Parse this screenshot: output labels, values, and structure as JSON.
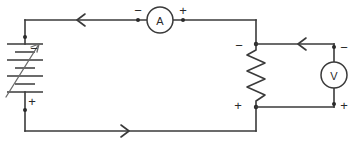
{
  "diagram": {
    "type": "circuit-schematic",
    "background_color": "#ffffff",
    "wire_color": "#3a3a3a"
  },
  "components": {
    "battery": {
      "name": "variable-battery",
      "symbol": "multi-cell battery with adjustment arrow",
      "terminal_top_label": "−",
      "terminal_bottom_label": "+",
      "cells": 4,
      "adjustable": "true"
    },
    "ammeter": {
      "name": "ammeter",
      "letter": "A",
      "terminal_left_label": "−",
      "terminal_right_label": "+"
    },
    "voltmeter": {
      "name": "voltmeter",
      "letter": "V",
      "terminal_top_label": "−",
      "terminal_bottom_label": "+"
    },
    "resistor": {
      "name": "resistor",
      "symbol": "zigzag",
      "terminal_top_label": "−",
      "terminal_bottom_label": "+",
      "peaks": 6
    }
  },
  "current_arrows": [
    {
      "name": "top-wire-current-arrow",
      "direction": "left"
    },
    {
      "name": "bottom-wire-current-arrow",
      "direction": "right"
    },
    {
      "name": "voltmeter-branch-current-arrow",
      "direction": "left"
    }
  ]
}
